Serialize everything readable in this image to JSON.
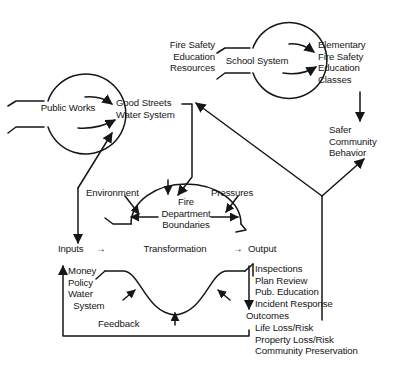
{
  "diagram": {
    "type": "systems-flow-diagram",
    "stroke_color": "#161616",
    "background_color": "#ffffff",
    "nodes": {
      "public_works": "Public Works",
      "good_streets_water": "Good Streets\nWater System",
      "fire_safety_education_resources": "Fire Safety\nEducation\nResources",
      "school_system": "School System",
      "elementary_classes": "Elementary\nFire Safety\nEducation\nClasses",
      "safer_community_behavior": "Safer\nCommunity\nBehavior",
      "environment": "Environment",
      "pressures": "Pressures",
      "fire_department_boundaries": "Fire\nDepartment\nBoundaries",
      "inputs": "Inputs",
      "inputs_arrow": "→",
      "transformation": "Transformation",
      "output_arrow": "→",
      "output": "Output",
      "input_items": "Money\nPolicy\nWater\n  System",
      "feedback": "Feedback",
      "output_items": "Inspections\nPlan Review\nPub. Education\nIncident Response",
      "outcomes": "Outcomes",
      "outcome_items": "Life Loss/Risk\nProperty Loss/Risk\nCommunity Preservation"
    }
  }
}
